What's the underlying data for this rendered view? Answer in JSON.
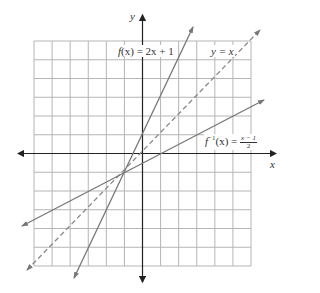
{
  "chart_data": {
    "type": "line",
    "title": "",
    "xlabel": "x",
    "ylabel": "y",
    "xlim": [
      -6,
      6
    ],
    "ylim": [
      -6,
      6
    ],
    "grid": true,
    "grid_step": 1,
    "legend_position": "inline",
    "series": [
      {
        "name": "f(x) = 2x + 1",
        "equation": "y = 2x + 1",
        "style": "solid",
        "x": [
          -3.75,
          2.8
        ],
        "y": [
          -6.5,
          6.6
        ]
      },
      {
        "name": "y = x",
        "equation": "y = x",
        "style": "dashed",
        "x": [
          -6.4,
          6.5
        ],
        "y": [
          -6.2,
          6.6
        ]
      },
      {
        "name": "f^-1(x) = (x - 1)/2",
        "equation": "y = (x - 1)/2",
        "style": "solid",
        "x": [
          -6.7,
          6.7
        ],
        "y": [
          -3.9,
          2.9
        ]
      }
    ],
    "intersection": {
      "x": -1,
      "y": -1
    },
    "annotations": [
      "f(x) = 2x + 1",
      "y = x",
      "f⁻¹(x) = (x − 1)/2"
    ]
  },
  "labels": {
    "x_axis": "x",
    "y_axis": "y",
    "f_prefix": "f",
    "f_arg": "(x) = 2x + 1",
    "yx": "y = x",
    "finv_f": "f",
    "finv_sup": "−1",
    "finv_arg": "(x) = ",
    "finv_num": "x − 1",
    "finv_den": "2"
  },
  "colors": {
    "grid": "#b5b5b5",
    "axis": "#222222",
    "line": "#777777"
  }
}
